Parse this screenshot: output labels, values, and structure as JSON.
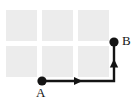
{
  "figure": {
    "name": "grid-path-diagram",
    "width": 137,
    "height": 105,
    "background_color": "#ffffff"
  },
  "grid": {
    "label": "city block grid",
    "rows": 2,
    "cols": 3,
    "cell_width": 31,
    "cell_height": 31,
    "gap": 5,
    "origin_x": 6,
    "origin_y": 10,
    "fill_color": "#ececec",
    "blocks": [
      {
        "id": "block-r1c1",
        "x": 6,
        "y": 10
      },
      {
        "id": "block-r1c2",
        "x": 42,
        "y": 10
      },
      {
        "id": "block-r1c3",
        "x": 78,
        "y": 10
      },
      {
        "id": "block-r2c1",
        "x": 6,
        "y": 46
      },
      {
        "id": "block-r2c2",
        "x": 42,
        "y": 46
      },
      {
        "id": "block-r2c3",
        "x": 78,
        "y": 46
      }
    ]
  },
  "path": {
    "stroke_color": "#141414",
    "stroke_width": 2.4,
    "start_point": {
      "label": "A",
      "x": 42,
      "y": 81
    },
    "end_point": {
      "label": "B",
      "x": 114,
      "y": 42
    },
    "segments": [
      {
        "id": "segment-horizontal",
        "from_x": 42,
        "from_y": 81,
        "to_x": 114,
        "to_y": 81,
        "direction": "right"
      },
      {
        "id": "segment-vertical",
        "from_x": 114,
        "from_y": 81,
        "to_x": 114,
        "to_y": 42,
        "direction": "up"
      }
    ],
    "arrowheads": [
      {
        "id": "arrowhead-right",
        "x": 79,
        "y": 81,
        "direction": "right"
      },
      {
        "id": "arrowhead-up",
        "x": 114,
        "y": 63,
        "direction": "up"
      }
    ],
    "dot_radius": 4.6
  },
  "labels": {
    "a": "A",
    "b": "B"
  }
}
